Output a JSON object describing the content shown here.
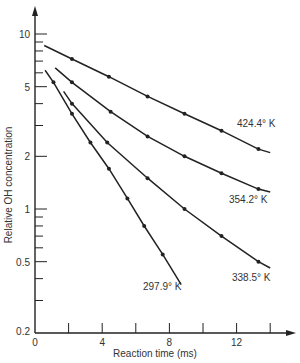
{
  "chart_data": {
    "type": "line",
    "title": "",
    "xlabel": "Reaction time (ms)",
    "ylabel": "Relative OH concentration",
    "yscale": "log",
    "xlim": [
      0,
      14
    ],
    "ylim": [
      0.2,
      10
    ],
    "grid": false,
    "x_ticks": [
      0,
      2,
      4,
      6,
      8,
      10,
      12,
      14
    ],
    "x_tick_labels": [
      "0",
      "4",
      "8",
      "12"
    ],
    "x_tick_label_values": [
      0,
      4,
      8,
      12
    ],
    "y_tick_labels": [
      "10",
      "5",
      "2",
      "1",
      "0.5",
      "0.2"
    ],
    "y_tick_label_values": [
      10,
      5,
      2,
      1,
      0.5,
      0.2
    ],
    "series": [
      {
        "name": "424.4° K",
        "label": "424.4° K",
        "line": {
          "x": [
            0.55,
            14.0
          ],
          "y": [
            8.6,
            2.1
          ]
        },
        "x": [
          2.2,
          4.4,
          6.7,
          8.9,
          11.1,
          13.3
        ],
        "y": [
          7.2,
          5.7,
          4.4,
          3.5,
          2.8,
          2.2
        ]
      },
      {
        "name": "354.2° K",
        "label": "354.2° K",
        "line": {
          "x": [
            1.2,
            14.0
          ],
          "y": [
            6.4,
            1.25
          ]
        },
        "x": [
          2.2,
          4.5,
          6.7,
          8.9,
          11.1,
          13.3
        ],
        "y": [
          5.3,
          3.6,
          2.6,
          2.0,
          1.6,
          1.3
        ]
      },
      {
        "name": "338.5° K",
        "label": "338.5° K",
        "line": {
          "x": [
            1.7,
            14.0
          ],
          "y": [
            4.7,
            0.46
          ]
        },
        "x": [
          2.2,
          4.3,
          6.7,
          8.9,
          11.1,
          13.3
        ],
        "y": [
          4.0,
          2.4,
          1.5,
          1.0,
          0.7,
          0.5
        ]
      },
      {
        "name": "297.9° K",
        "label": "297.9° K",
        "line": {
          "x": [
            0.6,
            8.7
          ],
          "y": [
            6.2,
            0.37
          ]
        },
        "x": [
          1.1,
          2.2,
          3.3,
          4.4,
          5.5,
          6.5,
          7.6
        ],
        "y": [
          5.3,
          3.5,
          2.4,
          1.7,
          1.15,
          0.8,
          0.55
        ]
      }
    ]
  }
}
